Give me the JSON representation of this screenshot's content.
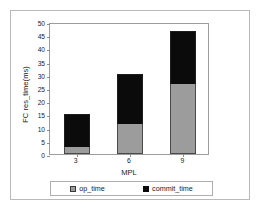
{
  "chart_data": {
    "type": "bar",
    "subtype": "stacked-bar",
    "title": "",
    "xlabel": "MPL",
    "ylabel": "FC res_time(ms)",
    "categories": [
      "3",
      "6",
      "9"
    ],
    "series": [
      {
        "name": "op_time",
        "color": "#9c9c9c",
        "values": [
          2.5,
          11.5,
          26.5
        ]
      },
      {
        "name": "commit_time",
        "color": "#0b0b0b",
        "values": [
          12.5,
          18.8,
          20.0
        ]
      }
    ],
    "totals": [
      15.0,
      30.3,
      46.5
    ],
    "ylim": [
      0,
      50
    ],
    "ytick_step": 5,
    "yticks": [
      "0",
      "5",
      "10",
      "15",
      "20",
      "25",
      "30",
      "35",
      "40",
      "45",
      "50"
    ],
    "ytick_values": [
      0,
      5,
      10,
      15,
      20,
      25,
      30,
      35,
      40,
      45,
      50
    ],
    "grid": false,
    "legend_position": "bottom",
    "legend": [
      {
        "label": "op_time",
        "swatch": "gray-square-swatch"
      },
      {
        "label": "commit_time",
        "swatch": "black-square-swatch"
      }
    ]
  }
}
